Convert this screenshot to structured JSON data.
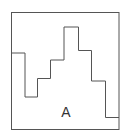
{
  "diagram": {
    "label": "A",
    "frame": {
      "x": 11.5,
      "y": 12.5,
      "width": 107.5,
      "height": 117
    },
    "step_path": [
      [
        11.5,
        53
      ],
      [
        25,
        53
      ],
      [
        25,
        97
      ],
      [
        37.5,
        97
      ],
      [
        37.5,
        78.5
      ],
      [
        50.5,
        78.5
      ],
      [
        50.5,
        60
      ],
      [
        64,
        60
      ],
      [
        64,
        27
      ],
      [
        78.5,
        27
      ],
      [
        78.5,
        50.5
      ],
      [
        91.5,
        50.5
      ],
      [
        91.5,
        81
      ],
      [
        105.5,
        81
      ],
      [
        105.5,
        117.5
      ],
      [
        119,
        117.5
      ]
    ],
    "colors": {
      "stroke": "#555555",
      "label": "#333333"
    }
  }
}
